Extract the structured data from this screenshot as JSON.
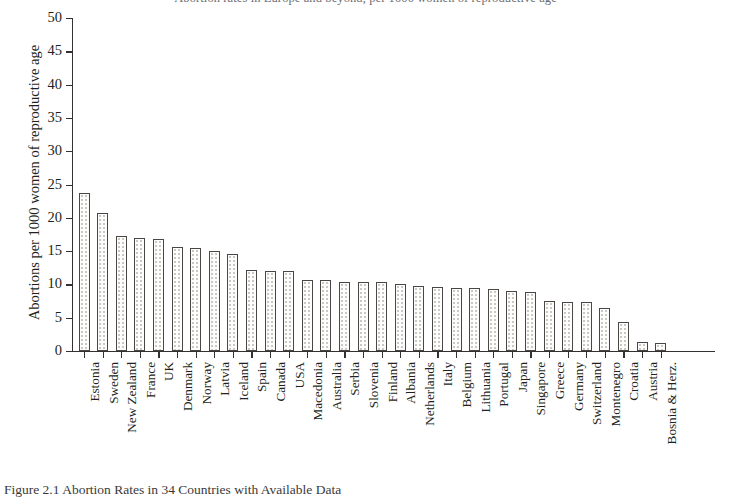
{
  "figure": {
    "title_partial": "Abortion rates in Europe and beyond, per 1000 women of reproductive age",
    "caption_partial": "Figure 2.1  Abortion Rates in 34 Countries with Available Data"
  },
  "chart_data": {
    "type": "bar",
    "title": "",
    "xlabel": "",
    "ylabel": "Abortions per 1000 women of reproductive age",
    "ylim": [
      0,
      50
    ],
    "ytick_step": 5,
    "yticks": [
      0,
      5,
      10,
      15,
      20,
      25,
      30,
      35,
      40,
      45,
      50
    ],
    "grid": false,
    "legend": "none",
    "bar_style": "white fill with stipple/dot pattern and dark outline",
    "categories": [
      "Estonia",
      "Sweden",
      "New Zealand",
      "France",
      "UK",
      "Denmark",
      "Norway",
      "Latvia",
      "Iceland",
      "Spain",
      "Canada",
      "USA",
      "Macedonia",
      "Australia",
      "Serbia",
      "Slovenia",
      "Finland",
      "Albania",
      "Netherlands",
      "Italy",
      "Belgium",
      "Lithuania",
      "Portugal",
      "Japan",
      "Singapore",
      "Greece",
      "Germany",
      "Switzerland",
      "Montenegro",
      "Croatia",
      "Austria",
      "Bosnia & Herz."
    ],
    "values": [
      23.7,
      20.7,
      17.3,
      17.0,
      16.8,
      15.6,
      15.5,
      15.0,
      14.5,
      12.2,
      12.0,
      12.0,
      10.7,
      10.6,
      10.4,
      10.4,
      10.3,
      10.1,
      9.8,
      9.6,
      9.5,
      9.4,
      9.3,
      9.0,
      8.9,
      7.5,
      7.4,
      7.3,
      6.5,
      4.3,
      1.3,
      1.2
    ]
  }
}
